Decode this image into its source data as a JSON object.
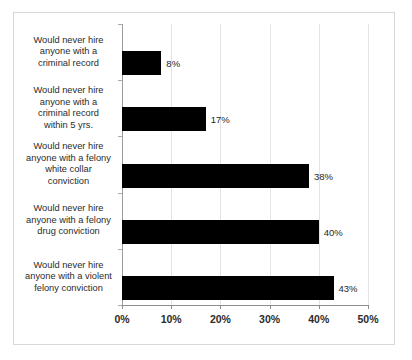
{
  "chart_data": {
    "type": "bar",
    "orientation": "horizontal",
    "title": "",
    "xlabel": "",
    "ylabel": "",
    "xlim": [
      0,
      50
    ],
    "grid": true,
    "legend": false,
    "value_suffix": "%",
    "categories": [
      "Would never hire anyone with a criminal record",
      "Would never hire anyone with a criminal record within 5 yrs.",
      "Would never hire anyone with a felony white collar conviction",
      "Would never hire anyone with a felony drug conviction",
      "Would never hire anyone with a violent felony conviction"
    ],
    "category_lines": [
      [
        "Would never hire",
        "anyone with a",
        "criminal record"
      ],
      [
        "Would never hire",
        "anyone with a",
        "criminal record",
        "within 5 yrs."
      ],
      [
        "Would never hire",
        "anyone with a felony",
        "white collar",
        "conviction"
      ],
      [
        "Would never hire",
        "anyone with a felony",
        "drug conviction"
      ],
      [
        "Would never hire",
        "anyone with a violent",
        "felony conviction"
      ]
    ],
    "values": [
      8,
      17,
      38,
      40,
      43
    ],
    "value_labels": [
      "8%",
      "17%",
      "38%",
      "40%",
      "43%"
    ],
    "xticks": [
      0,
      10,
      20,
      30,
      40,
      50
    ],
    "xtick_labels": [
      "0%",
      "10%",
      "20%",
      "30%",
      "40%",
      "50%"
    ],
    "colors": {
      "bar": "#000000",
      "grid": "#e4e4e4",
      "axis": "#8e8e8e",
      "text": "#2b2b2b",
      "frame": "#d8d8d8",
      "background": "#ffffff"
    }
  }
}
